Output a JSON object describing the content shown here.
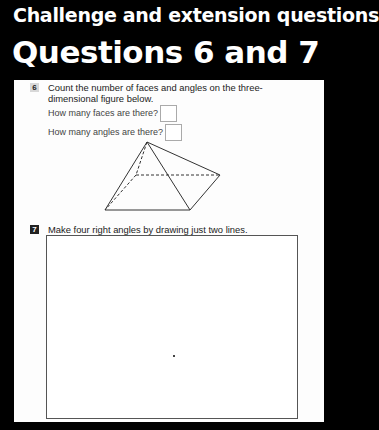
{
  "header": {
    "subtitle": "Challenge and extension questions",
    "title": "Questions 6 and 7"
  },
  "questions": [
    {
      "number": "6",
      "text": "Count the number of faces and angles on the three-dimensional figure below.",
      "prompts": [
        {
          "label": "How many faces are there?",
          "answer": ""
        },
        {
          "label": "How many angles are there?",
          "answer": ""
        }
      ],
      "figure": "square-based pyramid"
    },
    {
      "number": "7",
      "text": "Make four right angles by drawing just two lines."
    }
  ],
  "colors": {
    "background": "#000000",
    "panel": "#fdfdfd",
    "text": "#222222"
  }
}
